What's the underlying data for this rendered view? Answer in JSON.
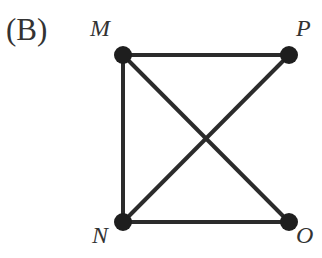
{
  "option_label": "(B)",
  "graph": {
    "nodes": [
      {
        "id": "M",
        "label": "M",
        "x": 123,
        "y": 55,
        "lx": 90,
        "ly": 15
      },
      {
        "id": "P",
        "label": "P",
        "x": 289,
        "y": 55,
        "lx": 296,
        "ly": 15
      },
      {
        "id": "N",
        "label": "N",
        "x": 123,
        "y": 222,
        "lx": 92,
        "ly": 222
      },
      {
        "id": "O",
        "label": "O",
        "x": 289,
        "y": 222,
        "lx": 296,
        "ly": 222
      }
    ],
    "edges": [
      [
        "M",
        "P"
      ],
      [
        "M",
        "N"
      ],
      [
        "M",
        "O"
      ],
      [
        "P",
        "N"
      ],
      [
        "N",
        "O"
      ]
    ],
    "colors": {
      "edge": "#2b2b2b",
      "node": "#1e1e1e"
    }
  }
}
